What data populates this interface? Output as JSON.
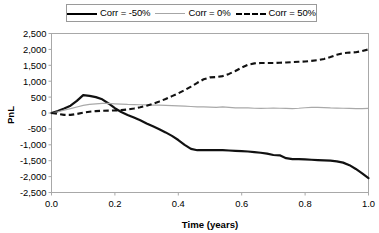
{
  "chart_data": {
    "type": "line",
    "title": "",
    "xlabel": "Time (years)",
    "ylabel": "PnL",
    "xlim": [
      0.0,
      1.0
    ],
    "ylim": [
      -2500,
      2500
    ],
    "grid": false,
    "legend_position": "top-center",
    "xticks": [
      "0.0",
      "0.2",
      "0.4",
      "0.6",
      "0.8",
      "1.0"
    ],
    "xtick_values": [
      0.0,
      0.2,
      0.4,
      0.6,
      0.8,
      1.0
    ],
    "yticks": [
      "2,500",
      "2,000",
      "1,500",
      "1,000",
      "500",
      "0",
      "-500",
      "-1,000",
      "-1,500",
      "-2,000",
      "-2,500"
    ],
    "ytick_values": [
      2500,
      2000,
      1500,
      1000,
      500,
      0,
      -500,
      -1000,
      -1500,
      -2000,
      -2500
    ],
    "x": [
      0.0,
      0.02,
      0.04,
      0.06,
      0.08,
      0.1,
      0.12,
      0.14,
      0.16,
      0.18,
      0.2,
      0.22,
      0.24,
      0.26,
      0.28,
      0.3,
      0.32,
      0.34,
      0.36,
      0.38,
      0.4,
      0.42,
      0.44,
      0.46,
      0.48,
      0.5,
      0.52,
      0.54,
      0.56,
      0.58,
      0.6,
      0.62,
      0.64,
      0.66,
      0.68,
      0.7,
      0.72,
      0.74,
      0.76,
      0.78,
      0.8,
      0.82,
      0.84,
      0.86,
      0.88,
      0.9,
      0.92,
      0.94,
      0.96,
      0.98,
      1.0
    ],
    "series": [
      {
        "name": "Corr = -50%",
        "style": "solid",
        "width": "thick",
        "color": "#111111",
        "values": [
          0,
          60,
          140,
          230,
          380,
          560,
          540,
          500,
          430,
          300,
          150,
          30,
          -60,
          -140,
          -230,
          -330,
          -420,
          -510,
          -610,
          -720,
          -850,
          -1000,
          -1130,
          -1170,
          -1170,
          -1170,
          -1170,
          -1170,
          -1180,
          -1190,
          -1200,
          -1210,
          -1230,
          -1250,
          -1280,
          -1320,
          -1330,
          -1420,
          -1450,
          -1450,
          -1460,
          -1470,
          -1480,
          -1490,
          -1500,
          -1520,
          -1560,
          -1640,
          -1760,
          -1900,
          -2050
        ]
      },
      {
        "name": "Corr = 0%",
        "style": "solid",
        "width": "thin",
        "color": "#a9a9a9",
        "values": [
          0,
          40,
          90,
          140,
          190,
          240,
          270,
          290,
          300,
          300,
          290,
          280,
          270,
          265,
          260,
          255,
          250,
          245,
          240,
          235,
          225,
          215,
          205,
          195,
          190,
          185,
          180,
          190,
          175,
          160,
          165,
          160,
          150,
          145,
          150,
          155,
          150,
          145,
          140,
          150,
          165,
          175,
          180,
          170,
          160,
          155,
          150,
          145,
          140,
          140,
          145
        ]
      },
      {
        "name": "Corr = 50%",
        "style": "dashed",
        "width": "thick",
        "color": "#111111",
        "values": [
          0,
          -30,
          -60,
          -60,
          -30,
          10,
          40,
          60,
          70,
          75,
          80,
          90,
          110,
          140,
          180,
          230,
          290,
          360,
          440,
          530,
          620,
          720,
          830,
          950,
          1060,
          1120,
          1130,
          1160,
          1230,
          1320,
          1430,
          1520,
          1560,
          1570,
          1570,
          1570,
          1580,
          1590,
          1600,
          1610,
          1620,
          1640,
          1660,
          1700,
          1760,
          1830,
          1880,
          1900,
          1910,
          1950,
          2000
        ]
      }
    ]
  },
  "legend": {
    "items": [
      {
        "label": "Corr = -50%"
      },
      {
        "label": "Corr = 0%"
      },
      {
        "label": "Corr = 50%"
      }
    ]
  }
}
